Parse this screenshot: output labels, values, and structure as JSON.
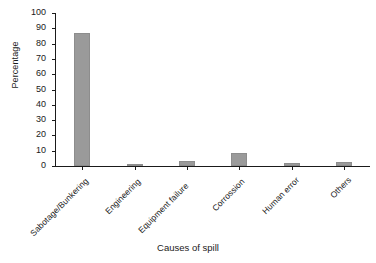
{
  "chart_data": {
    "type": "bar",
    "title": "",
    "xlabel": "Causes of spill",
    "ylabel": "Percentage",
    "categories": [
      "Sabotage/Bunkering",
      "Engineering",
      "Equipment failure",
      "Corrossion",
      "Human error",
      "Others"
    ],
    "values": [
      87,
      1,
      3.5,
      8.5,
      2,
      2.5
    ],
    "ylim": [
      0,
      100
    ],
    "yticks": [
      0,
      10,
      20,
      30,
      40,
      50,
      60,
      70,
      80,
      90,
      100
    ],
    "ytick_labels": [
      "0",
      "10",
      "20",
      "30",
      "40",
      "50",
      "60",
      "70",
      "80",
      "90",
      "100"
    ],
    "grid": false,
    "legend": false,
    "bar_color": "#9a9a9a",
    "axis_color": "#1a1a1a",
    "background_color": "#ffffff",
    "xtick_label_rotation": -45
  },
  "axes": {
    "y_title": "Percentage",
    "x_title": "Causes of spill"
  }
}
